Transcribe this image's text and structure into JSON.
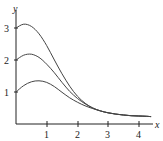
{
  "chart_data": {
    "type": "line",
    "title": "",
    "xlabel": "x",
    "ylabel": "y",
    "xlim": [
      0,
      4.5
    ],
    "ylim": [
      0,
      3.4
    ],
    "grid": false,
    "legend": null,
    "x_ticks": [
      "1",
      "2",
      "3",
      "4"
    ],
    "y_ticks": [
      "1",
      "2",
      "3"
    ],
    "x": [
      0,
      0.25,
      0.5,
      0.75,
      1.0,
      1.25,
      1.5,
      1.75,
      2.0,
      2.25,
      2.5,
      2.75,
      3.0,
      3.25,
      3.5,
      3.75,
      4.0,
      4.25,
      4.4
    ],
    "series": [
      {
        "name": "y(0)=3",
        "values": [
          3.0,
          3.12,
          3.05,
          2.82,
          2.45,
          2.0,
          1.57,
          1.18,
          0.87,
          0.65,
          0.5,
          0.41,
          0.35,
          0.31,
          0.28,
          0.26,
          0.25,
          0.24,
          0.23
        ]
      },
      {
        "name": "y(0)=2",
        "values": [
          2.0,
          2.15,
          2.18,
          2.08,
          1.87,
          1.6,
          1.3,
          1.02,
          0.8,
          0.63,
          0.5,
          0.41,
          0.35,
          0.31,
          0.28,
          0.26,
          0.25,
          0.24,
          0.23
        ]
      },
      {
        "name": "y(0)=1",
        "values": [
          1.0,
          1.2,
          1.32,
          1.35,
          1.3,
          1.17,
          0.99,
          0.82,
          0.68,
          0.57,
          0.48,
          0.41,
          0.35,
          0.31,
          0.28,
          0.26,
          0.25,
          0.24,
          0.23
        ]
      }
    ]
  },
  "labels": {
    "x_axis": "x",
    "y_axis": "y",
    "x_ticks": [
      "1",
      "2",
      "3",
      "4"
    ],
    "y_ticks": [
      "1",
      "2",
      "3"
    ]
  }
}
